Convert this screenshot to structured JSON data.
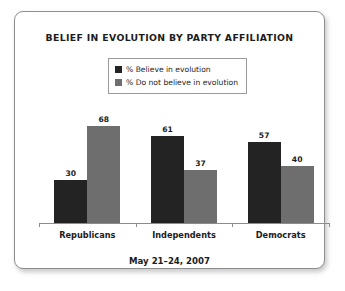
{
  "card": {
    "title": "BELIEF IN EVOLUTION BY PARTY AFFILIATION",
    "footer_date": "May 21–24, 2007"
  },
  "legend": {
    "items": [
      {
        "label": "% Believe in evolution",
        "color": "#232323",
        "swatch_icon": "square-swatch-icon"
      },
      {
        "label": "% Do not believe in evolution",
        "color": "#6e6e6e",
        "swatch_icon": "square-swatch-icon"
      }
    ]
  },
  "chart_data": {
    "type": "bar",
    "title": "BELIEF IN EVOLUTION BY PARTY AFFILIATION",
    "subtitle": "May 21–24, 2007",
    "xlabel": "",
    "ylabel": "",
    "ylim": [
      0,
      100
    ],
    "grid": false,
    "legend_position": "top-center",
    "categories": [
      "Republicans",
      "Independents",
      "Democrats"
    ],
    "series": [
      {
        "name": "% Believe in evolution",
        "color": "#232323",
        "values": [
          30,
          61,
          57
        ]
      },
      {
        "name": "% Do not believe in evolution",
        "color": "#6e6e6e",
        "values": [
          68,
          37,
          40
        ]
      }
    ]
  }
}
